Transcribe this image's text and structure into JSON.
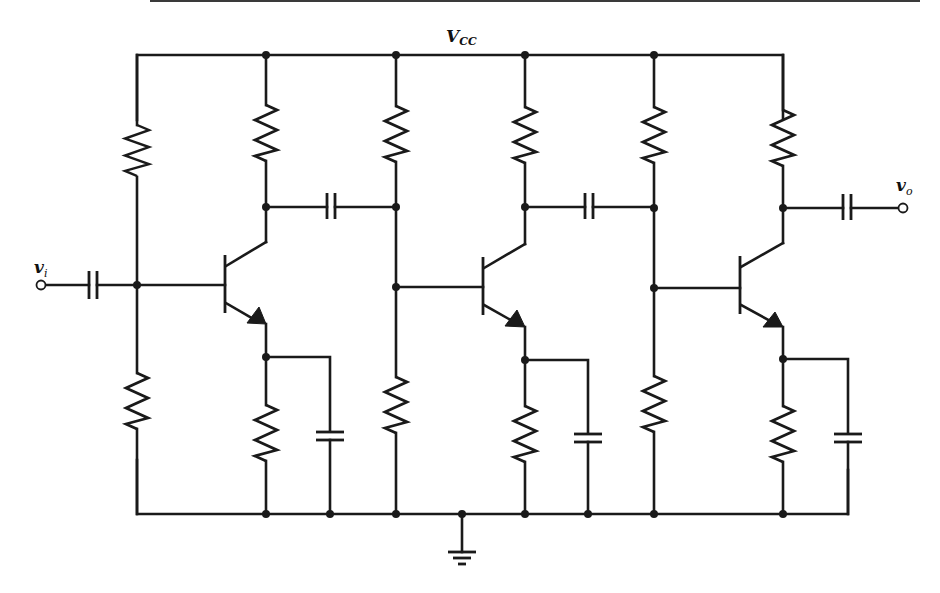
{
  "diagram": {
    "supply_label": {
      "main": "V",
      "sub": "CC"
    },
    "input_label": {
      "main": "v",
      "sub": "i"
    },
    "output_label": {
      "main": "v",
      "sub": "o"
    },
    "colors": {
      "ink": "#1a1a1a",
      "background": "#ffffff"
    },
    "stages": [
      {
        "name": "stage-1",
        "transistor": "npn",
        "components": [
          "bias-resistor-top",
          "bias-resistor-bottom",
          "collector-resistor",
          "emitter-resistor",
          "emitter-bypass-capacitor"
        ]
      },
      {
        "name": "stage-2",
        "transistor": "npn",
        "components": [
          "bias-resistor-top",
          "bias-resistor-bottom",
          "collector-resistor",
          "emitter-resistor",
          "emitter-bypass-capacitor"
        ]
      },
      {
        "name": "stage-3",
        "transistor": "npn",
        "components": [
          "bias-resistor-top",
          "bias-resistor-bottom",
          "collector-resistor",
          "emitter-resistor",
          "emitter-bypass-capacitor"
        ]
      }
    ],
    "coupling_capacitors": [
      "input-coupling",
      "stage1-to-stage2",
      "stage2-to-stage3",
      "output-coupling"
    ],
    "ground": "common ground"
  }
}
